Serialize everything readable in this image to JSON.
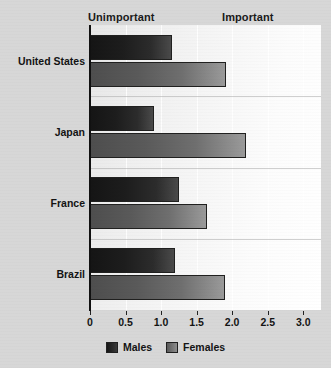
{
  "annotations": {
    "left": "Unimportant",
    "right": "Important"
  },
  "legend": {
    "items": [
      {
        "label": "Males",
        "color": "#1d1d1d"
      },
      {
        "label": "Females",
        "color": "#6f6f6f"
      }
    ]
  },
  "chart_data": {
    "type": "bar",
    "title": "",
    "xlabel": "",
    "ylabel": "",
    "orientation": "horizontal",
    "categories": [
      "United States",
      "Japan",
      "France",
      "Brazil"
    ],
    "series": [
      {
        "name": "Males",
        "values": [
          1.15,
          0.9,
          1.25,
          1.2
        ]
      },
      {
        "name": "Females",
        "values": [
          1.92,
          2.2,
          1.65,
          1.9
        ]
      }
    ],
    "xlim": [
      0,
      3.25
    ],
    "xticks": [
      0,
      0.5,
      1.0,
      1.5,
      2.0,
      2.5,
      3.0
    ],
    "xticklabels": [
      "0",
      "0.5",
      "1.0",
      "1.5",
      "2.0",
      "2.5",
      "3.0"
    ],
    "grid": true,
    "grid_axis": "x",
    "legend_position": "bottom-center",
    "annotations": [
      "Unimportant",
      "Important"
    ]
  }
}
